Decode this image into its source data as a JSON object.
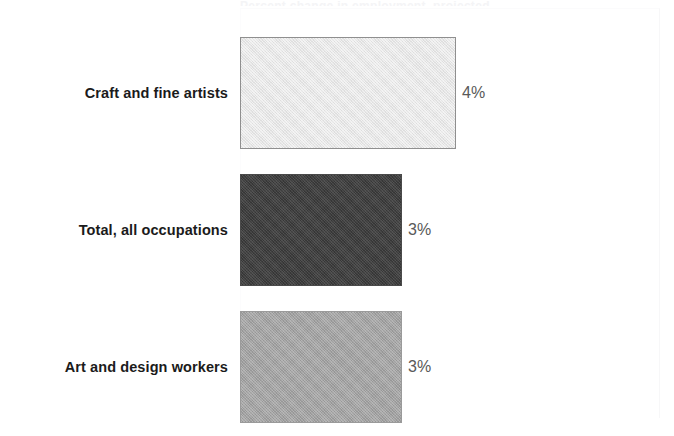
{
  "chart_data": {
    "type": "bar",
    "orientation": "horizontal",
    "title": "",
    "xlabel": "",
    "ylabel": "",
    "grid": false,
    "legend": "none",
    "xlim": [
      0,
      5
    ],
    "categories": [
      "Craft and fine artists",
      "Total, all occupations",
      "Art and design workers"
    ],
    "values": [
      4,
      3,
      3
    ],
    "value_labels": [
      "4%",
      "3%",
      "3%"
    ],
    "units": "percent",
    "bar_colors": [
      "#e6e6e6",
      "#3f3f3f",
      "#a2a2a2"
    ],
    "bar_border_colors": [
      "#8f8f8f",
      "#4a4a4a",
      "#9a9a9a"
    ],
    "bars": [
      {
        "category": "Craft and fine artists",
        "value": 4,
        "label": "4%",
        "color": "#e6e6e6"
      },
      {
        "category": "Total, all occupations",
        "value": 3,
        "label": "3%",
        "color": "#3f3f3f"
      },
      {
        "category": "Art and design workers",
        "value": 3,
        "label": "3%",
        "color": "#a2a2a2"
      }
    ]
  },
  "figure": {
    "background": "#ffffff",
    "label_color": "#1b1b1b",
    "value_color": "#595959",
    "clipped_title": "Percent change in employment, projected"
  }
}
